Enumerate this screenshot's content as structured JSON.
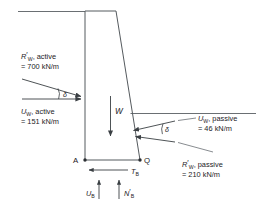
{
  "figure": {
    "type": "engineering-free-body-diagram",
    "colors": {
      "structure": "#555a5e",
      "ground": "#6a6f73",
      "force": "#3a3f43",
      "text": "#1d2125",
      "background": "#ffffff"
    }
  },
  "labels": {
    "active_resultant": {
      "symbol": "R",
      "prime": "′",
      "subscript": "W",
      "qualifier": ", active",
      "value": "= 700 kN/m"
    },
    "active_water": {
      "symbol": "U",
      "subscript": "W",
      "qualifier": ", active",
      "value": "= 151 kN/m"
    },
    "passive_water": {
      "symbol": "U",
      "subscript": "W",
      "qualifier": ", passive",
      "value": "= 46 kN/m"
    },
    "passive_resultant": {
      "symbol": "R",
      "prime": "′",
      "subscript": "W",
      "qualifier": ", passive",
      "value": "= 210 kN/m"
    },
    "weight": {
      "symbol": "W"
    },
    "base_shear": {
      "symbol": "T",
      "subscript": "B"
    },
    "base_water": {
      "symbol": "U",
      "subscript": "B"
    },
    "base_normal": {
      "symbol": "N",
      "prime": "′",
      "subscript": "B"
    },
    "node_a": "A",
    "node_q": "Q",
    "friction_angle_left": "δ",
    "friction_angle_right": "δ"
  }
}
